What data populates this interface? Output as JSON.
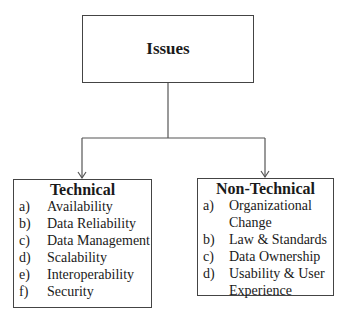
{
  "root": {
    "title": "Issues"
  },
  "branches": [
    {
      "title": "Technical",
      "items": [
        {
          "marker": "a)",
          "text": "Availability"
        },
        {
          "marker": "b)",
          "text": "Data Reliability"
        },
        {
          "marker": "c)",
          "text": "Data Management"
        },
        {
          "marker": "d)",
          "text": "Scalability"
        },
        {
          "marker": "e)",
          "text": "Interoperability"
        },
        {
          "marker": "f)",
          "text": "Security"
        }
      ]
    },
    {
      "title": "Non-Technical",
      "items": [
        {
          "marker": "a)",
          "text": "Organizational Change"
        },
        {
          "marker": "b)",
          "text": "Law & Standards"
        },
        {
          "marker": "c)",
          "text": "Data Ownership"
        },
        {
          "marker": "d)",
          "text": "Usability & User Experience"
        }
      ]
    }
  ],
  "colors": {
    "line": "#444444",
    "text": "#1a1a1a",
    "background": "#ffffff"
  }
}
